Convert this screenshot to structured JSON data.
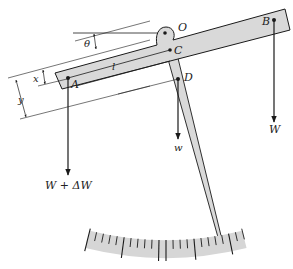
{
  "diagram": {
    "points": {
      "O": "O",
      "A": "A",
      "B": "B",
      "C": "C",
      "D": "D"
    },
    "dimensions": {
      "theta": "θ",
      "x": "x",
      "y": "y",
      "l": "l"
    },
    "forces": {
      "left_load": "W + ΔW",
      "right_load": "W",
      "pointer_weight": "w"
    },
    "scale": {
      "tick_count": 23,
      "major_tick_every": 5
    },
    "colors": {
      "beam_fill": "#d9d9d9",
      "scale_fill": "#d6d6d6",
      "line": "#1a1a1a"
    }
  }
}
